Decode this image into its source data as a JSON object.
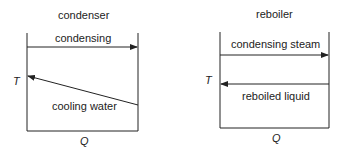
{
  "left_diagram": {
    "title": "condenser",
    "hot_stream_label": "condensing",
    "cold_stream_label": "cooling water",
    "y_axis_label": "T",
    "x_axis_label": "Q"
  },
  "right_diagram": {
    "title": "reboiler",
    "hot_stream_label": "condensing steam",
    "cold_stream_label": "reboiled liquid",
    "y_axis_label": "T",
    "x_axis_label": "Q"
  },
  "colors": {
    "line": "#222222",
    "background": "#ffffff"
  }
}
